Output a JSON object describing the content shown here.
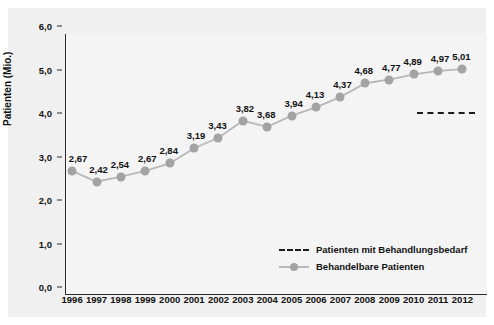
{
  "chart_data": {
    "type": "line",
    "title": "",
    "xlabel": "",
    "ylabel": "Patienten (Mio.)",
    "ylim": [
      0.0,
      6.0
    ],
    "ytick_labels": [
      "0,0",
      "1,0",
      "2,0",
      "3,0",
      "4,0",
      "5,0",
      "6,0"
    ],
    "ytick_values": [
      0.0,
      1.0,
      2.0,
      3.0,
      4.0,
      5.0,
      6.0
    ],
    "grid": false,
    "legend_position": "bottom-center",
    "categories": [
      "1996",
      "1997",
      "1998",
      "1999",
      "2000",
      "2001",
      "2002",
      "2003",
      "2004",
      "2005",
      "2006",
      "2007",
      "2008",
      "2009",
      "2010",
      "2011",
      "2012"
    ],
    "series": [
      {
        "name": "Behandelbare Patienten",
        "style": "line-marker",
        "color": "#a3a3a3",
        "values": [
          2.67,
          2.42,
          2.54,
          2.67,
          2.84,
          3.19,
          3.43,
          3.82,
          3.68,
          3.94,
          4.13,
          4.37,
          4.68,
          4.77,
          4.89,
          4.97,
          5.01
        ],
        "data_labels": [
          "2,67",
          "2,42",
          "2,54",
          "2,67",
          "2,84",
          "3,19",
          "3,43",
          "3,82",
          "3,68",
          "3,94",
          "4,13",
          "4,37",
          "4,68",
          "4,77",
          "4,89",
          "4,97",
          "5,01"
        ]
      },
      {
        "name": "Patienten mit Behandlungsbedarf",
        "style": "dashed",
        "color": "#1b1b1b",
        "segment_start_category": "2010",
        "segment_end_category": "2012",
        "value": 4.2
      }
    ]
  },
  "legend": {
    "items": [
      {
        "label": "Patienten mit Behandlungsbedarf",
        "key": "dashed"
      },
      {
        "label": "Behandelbare Patienten",
        "key": "solid"
      }
    ]
  },
  "colors": {
    "panel_background": "#f0f0f0",
    "plot_background": "#f4f4f4",
    "axis": "#2b2b2b",
    "series_marker": "#a3a3a3",
    "series_line": "#b8b8b8",
    "dashed_series": "#1b1b1b",
    "text": "#111111"
  }
}
